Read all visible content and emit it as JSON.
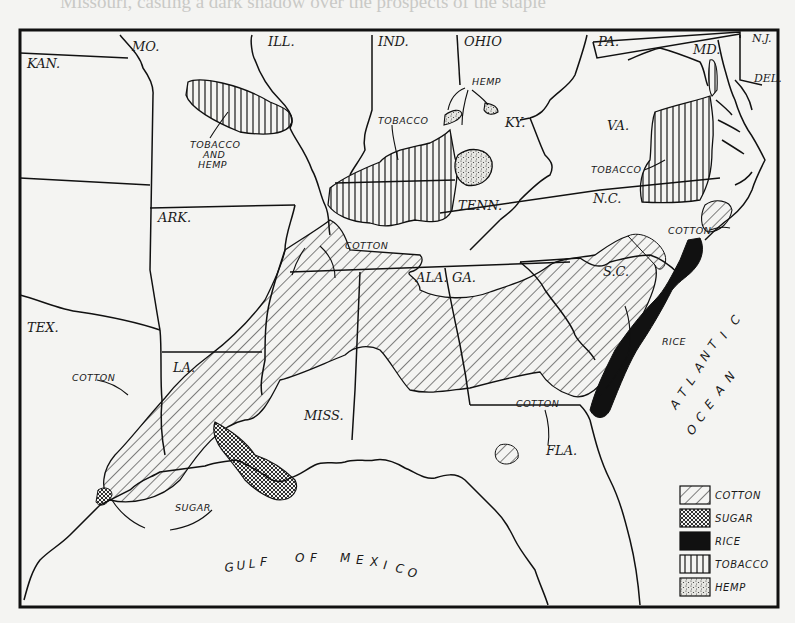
{
  "map": {
    "title": "Southern agricultural regions: cotton, sugar, rice, tobacco and hemp",
    "states": {
      "mo": "MO.",
      "ill": "ILL.",
      "ind": "IND.",
      "ohio": "OHIO",
      "pa": "PA.",
      "md": "MD.",
      "nj": "N.J.",
      "del": "DEL.",
      "kan": "KAN.",
      "ky": "KY.",
      "va": "VA.",
      "tenn": "TENN.",
      "nc": "N.C.",
      "ark": "ARK.",
      "ala": "ALA.",
      "ga": "GA.",
      "sc": "S.C.",
      "tex": "TEX.",
      "la": "LA.",
      "miss": "MISS.",
      "fla": "FLA."
    },
    "region_labels": {
      "tobacco_and_hemp_1": "TOBACCO",
      "tobacco_and_hemp_2": "AND",
      "tobacco_and_hemp_3": "HEMP",
      "hemp_ky": "HEMP",
      "tobacco_tenn": "TOBACCO",
      "tobacco_va": "TOBACCO",
      "cotton_nc": "COTTON",
      "cotton_ala": "COTTON",
      "cotton_tex": "COTTON",
      "cotton_ga": "COTTON",
      "rice_sc": "RICE",
      "sugar_la": "SUGAR"
    },
    "water": {
      "gulf": [
        "G",
        "U",
        "L",
        "F",
        " ",
        "O",
        "F",
        " ",
        "M",
        "E",
        "X",
        "I",
        "C",
        "O"
      ],
      "atlantic": [
        "A",
        "T",
        "L",
        "A",
        "N",
        "T",
        "I",
        "C"
      ],
      "ocean": [
        "O",
        "C",
        "E",
        "A",
        "N"
      ]
    },
    "legend": {
      "items": [
        {
          "label": "COTTON",
          "pattern": "diagonal-hatch"
        },
        {
          "label": "SUGAR",
          "pattern": "crosshatch"
        },
        {
          "label": "RICE",
          "pattern": "solid-black"
        },
        {
          "label": "TOBACCO",
          "pattern": "vertical-lines"
        },
        {
          "label": "HEMP",
          "pattern": "stipple"
        }
      ]
    },
    "colors": {
      "paper": "#f4f4f2",
      "ink": "#1a1a1a",
      "bleed_text": "#c9c9c6"
    }
  },
  "bleed_through_text": [
    "Missouri, casting a dark shadow over the prospects of the staple",
    "                                                                              ",
    "          the deep soil stripped the Eastern states in the special",
    "          the seed, and the middle of the eighteenth century",
    "          added nearly the whole area of Virginia.",
    "          tobacco required a large expenditure of labor. The",
    "          was to prepare the seedbeds, burning brush on the ground",
    "          to destroy the weed seeds and then sow the extremely minute",
    "          tobacco seeds. The seedlings were transplanted",
    "          from the beds to the fields. Not only had the fields to be kept",
    "          free of weeds and the ground loosened by plowing and",
    "          hoeing, but the plants had to be topped and wormed. The",
    "          season, when the leaves had to be 'suckered', the plants were re-",
    "          moved, and a constant watch against cutworms and tobacco worms",
    "          had to be maintained. After the tobacco matured it was cut and hung",
    "          up in tall, log tobacco houses, where it was 'cured' or dried",
    "          by fires and smoke. It was now ready to be packed in hogs-",
    "          heads. Increased during the colonial period about a thousand"
  ]
}
